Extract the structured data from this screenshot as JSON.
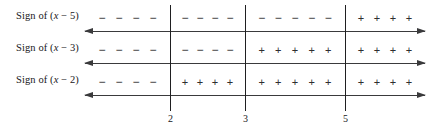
{
  "chart_data": {
    "type": "table",
    "title": "",
    "subtitle": "",
    "xlabel": "",
    "ylabel": "",
    "grid": false,
    "legend": "none",
    "critical_values": [
      2,
      3,
      5
    ],
    "critical_value_labels": [
      "2",
      "3",
      "5"
    ],
    "intervals": [
      "(-inf, 2)",
      "(2, 3)",
      "(3, 5)",
      "(5, inf)"
    ],
    "rows": [
      {
        "label_prefix": "Sign of (",
        "label_var": "x",
        "label_suffix": " − 5)",
        "expression": "x - 5",
        "signs": [
          "-",
          "-",
          "-",
          "+"
        ],
        "sign_counts": [
          4,
          4,
          5,
          4
        ]
      },
      {
        "label_prefix": "Sign of (",
        "label_var": "x",
        "label_suffix": " − 3)",
        "expression": "x - 3",
        "signs": [
          "-",
          "-",
          "+",
          "+"
        ],
        "sign_counts": [
          4,
          4,
          5,
          4
        ]
      },
      {
        "label_prefix": "Sign of (",
        "label_var": "x",
        "label_suffix": " − 2)",
        "expression": "x - 2",
        "signs": [
          "-",
          "+",
          "+",
          "+"
        ],
        "sign_counts": [
          4,
          4,
          5,
          4
        ]
      }
    ],
    "glyphs": {
      "positive": "+",
      "negative": "−"
    },
    "axis_style": {
      "arrow_left": true,
      "arrow_right": true
    }
  },
  "geometry": {
    "axis_left_px": 85,
    "axis_width_px": 340,
    "axis_y_px": [
      31,
      63,
      95
    ],
    "vline_x_px": [
      170,
      245,
      345
    ],
    "vline_top_px": 5,
    "vline_height_px": 106,
    "sign_row_y_px": [
      11,
      43,
      75
    ],
    "label_y_px": [
      10,
      42,
      74
    ]
  }
}
